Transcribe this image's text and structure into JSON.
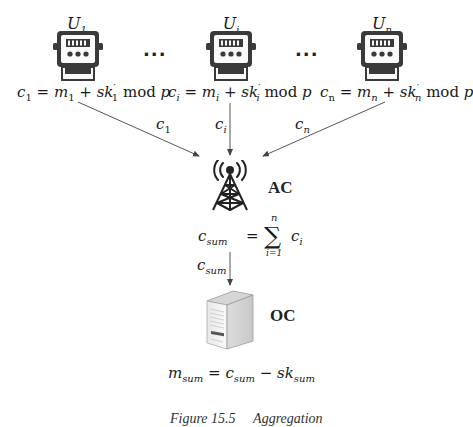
{
  "diagram": {
    "users": [
      {
        "id": "U1",
        "label_base": "U",
        "label_sub": "1",
        "ciphertext_label_base": "c",
        "ciphertext_label_sub": "1",
        "equation": {
          "lhs": "c",
          "lhs_sub": "1",
          "m": "m",
          "m_sub": "1",
          "plus": "+",
          "sk": "sk",
          "sk_sup": "′",
          "sk_sub": "1",
          "mod": "mod",
          "p": "p",
          "eq": "="
        }
      },
      {
        "id": "Ui",
        "label_base": "U",
        "label_sub": "i",
        "ciphertext_label_base": "c",
        "ciphertext_label_sub": "i",
        "equation": {
          "lhs": "c",
          "lhs_sub": "i",
          "m": "m",
          "m_sub": "i",
          "plus": "+",
          "sk": "sk",
          "sk_sup": "′",
          "sk_sub": "i",
          "mod": "mod",
          "p": "p",
          "eq": "="
        }
      },
      {
        "id": "Un",
        "label_base": "U",
        "label_sub": "n",
        "ciphertext_label_base": "c",
        "ciphertext_label_sub": "n",
        "equation": {
          "lhs": "c",
          "lhs_sub": "n",
          "m": "m",
          "m_sub": "n",
          "plus": "+",
          "sk": "sk",
          "sk_sup": "′",
          "sk_sub": "n",
          "mod": "mod",
          "p": "p",
          "eq": "="
        }
      }
    ],
    "ellipsis": "···",
    "aggregator": {
      "label": "AC",
      "icon": "cell-tower-icon",
      "formula": {
        "lhs": "c",
        "lhs_sub": "sum",
        "eq": "=",
        "sigma": "∑",
        "upper": "n",
        "lower": "i=1",
        "term": "c",
        "term_sub": "i"
      }
    },
    "aggregate_edge_label": {
      "base": "c",
      "sub": "sum"
    },
    "operator": {
      "label": "OC",
      "icon": "server-icon",
      "formula": {
        "lhs": "m",
        "lhs_sub": "sum",
        "eq": "=",
        "a": "c",
        "a_sub": "sum",
        "minus": "−",
        "b": "sk",
        "b_sub": "sum"
      }
    },
    "meter_icon": "smart-meter-icon"
  },
  "caption": {
    "figure": "Figure 15.5",
    "title": "Aggregation"
  },
  "colors": {
    "line": "#555555",
    "icon_dark": "#3a3a3a",
    "server_light": "#efefef"
  }
}
